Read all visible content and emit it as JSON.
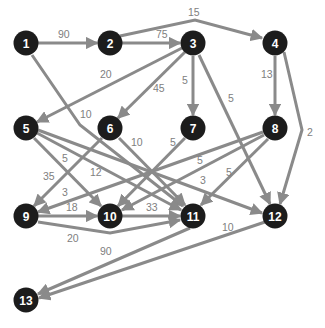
{
  "diagram": {
    "type": "directed-weighted-graph",
    "colors": {
      "node_fill": "#1c1c1c",
      "node_text": "#ffffff",
      "edge": "#8a8a8a",
      "label": "#808080",
      "background": "#ffffff"
    },
    "nodes": [
      {
        "id": "1",
        "x": 26,
        "y": 43
      },
      {
        "id": "2",
        "x": 110,
        "y": 43
      },
      {
        "id": "3",
        "x": 193,
        "y": 43
      },
      {
        "id": "4",
        "x": 275,
        "y": 43
      },
      {
        "id": "5",
        "x": 26,
        "y": 128
      },
      {
        "id": "6",
        "x": 110,
        "y": 128
      },
      {
        "id": "7",
        "x": 193,
        "y": 128
      },
      {
        "id": "8",
        "x": 275,
        "y": 128
      },
      {
        "id": "9",
        "x": 26,
        "y": 216
      },
      {
        "id": "10",
        "x": 110,
        "y": 216
      },
      {
        "id": "11",
        "x": 193,
        "y": 216
      },
      {
        "id": "12",
        "x": 275,
        "y": 216
      },
      {
        "id": "13",
        "x": 26,
        "y": 300
      }
    ],
    "edges": [
      {
        "from": "1",
        "to": "2",
        "weight": "90",
        "path": "M37,43 L97,43",
        "lx": 58,
        "ly": 38
      },
      {
        "from": "1",
        "to": "11",
        "weight": "10",
        "path": "M32,55 L80,125 L183,206",
        "lx": 80,
        "ly": 118
      },
      {
        "from": "2",
        "to": "3",
        "weight": "75",
        "path": "M122,43 L180,43",
        "lx": 156,
        "ly": 38
      },
      {
        "from": "2",
        "to": "4",
        "weight": "15",
        "path": "M120,36 L195,20 L262,38",
        "lx": 188,
        "ly": 16
      },
      {
        "from": "3",
        "to": "5",
        "weight": "20",
        "path": "M182,48 L37,122",
        "lx": 100,
        "ly": 78
      },
      {
        "from": "3",
        "to": "6",
        "weight": "45",
        "path": "M185,52 L118,118",
        "lx": 153,
        "ly": 92
      },
      {
        "from": "3",
        "to": "7",
        "weight": "5",
        "path": "M193,56 L193,115",
        "lx": 182,
        "ly": 84
      },
      {
        "from": "3",
        "to": "12",
        "weight": "5",
        "path": "M199,55 L270,204",
        "lx": 228,
        "ly": 102
      },
      {
        "from": "4",
        "to": "8",
        "weight": "13",
        "path": "M275,56 L275,115",
        "lx": 261,
        "ly": 78
      },
      {
        "from": "4",
        "to": "12",
        "weight": "2",
        "path": "M284,52 L302,130 L280,204",
        "lx": 307,
        "ly": 136
      },
      {
        "from": "5",
        "to": "10",
        "weight": "5",
        "path": "M34,138 L101,206",
        "lx": 62,
        "ly": 162
      },
      {
        "from": "5",
        "to": "11",
        "weight": "12",
        "path": "M37,133 L181,210",
        "lx": 90,
        "ly": 176
      },
      {
        "from": "5",
        "to": "12",
        "weight": "3",
        "path": "M38,130 L262,213",
        "lx": 200,
        "ly": 184
      },
      {
        "from": "6",
        "to": "9",
        "weight": "35",
        "path": "M102,138 L34,206",
        "lx": 43,
        "ly": 180
      },
      {
        "from": "6",
        "to": "11",
        "weight": "10",
        "path": "M119,138 L185,205",
        "lx": 131,
        "ly": 146
      },
      {
        "from": "7",
        "to": "10",
        "weight": "5",
        "path": "M185,138 L118,206",
        "lx": 170,
        "ly": 146
      },
      {
        "from": "8",
        "to": "9",
        "weight": "3",
        "path": "M263,132 L38,212",
        "lx": 62,
        "ly": 196
      },
      {
        "from": "8",
        "to": "10",
        "weight": "5",
        "path": "M264,135 L122,210",
        "lx": 197,
        "ly": 164
      },
      {
        "from": "8",
        "to": "11",
        "weight": "5",
        "path": "M268,139 L201,205",
        "lx": 226,
        "ly": 176
      },
      {
        "from": "9",
        "to": "10",
        "weight": "18",
        "path": "M38,216 L97,216",
        "lx": 66,
        "ly": 211
      },
      {
        "from": "9",
        "to": "11",
        "weight": "20",
        "path": "M38,222 L110,233 L180,220",
        "lx": 67,
        "ly": 242
      },
      {
        "from": "10",
        "to": "11",
        "weight": "33",
        "path": "M122,216 L180,216",
        "lx": 146,
        "ly": 211
      },
      {
        "from": "11",
        "to": "13",
        "weight": "90",
        "path": "M190,228 L38,294",
        "lx": 100,
        "ly": 255
      },
      {
        "from": "12",
        "to": "13",
        "weight": "10",
        "path": "M265,222 L39,298",
        "lx": 222,
        "ly": 231
      }
    ]
  }
}
